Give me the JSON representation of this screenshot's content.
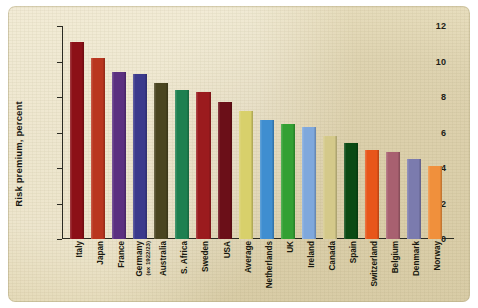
{
  "chart_data": {
    "type": "bar",
    "title": "",
    "xlabel": "",
    "ylabel": "Risk premium, percent",
    "ylim": [
      0,
      12
    ],
    "ytick_step": 2,
    "yticks": [
      "0",
      "2",
      "4",
      "6",
      "8",
      "10",
      "12"
    ],
    "grid": false,
    "legend": "none",
    "categories": [
      "Italy",
      "Japan",
      "France",
      "Germany",
      "Australia",
      "S. Africa",
      "Sweden",
      "USA",
      "Average",
      "Netherlands",
      "UK",
      "Ireland",
      "Canada",
      "Spain",
      "Switzerland",
      "Belgium",
      "Denmark",
      "Norway"
    ],
    "category_sublabels": {
      "Germany": "(ex 1922/23)"
    },
    "values": [
      11.1,
      10.2,
      9.4,
      9.3,
      8.8,
      8.4,
      8.3,
      7.7,
      7.2,
      6.7,
      6.5,
      6.3,
      5.8,
      5.4,
      5.0,
      4.9,
      4.5,
      4.1
    ],
    "bar_colors": [
      "#8C1017",
      "#B9361F",
      "#5B3080",
      "#3B3A8C",
      "#4A4520",
      "#1E8050",
      "#9B1B1E",
      "#6B0F18",
      "#D8D06B",
      "#3F8ED0",
      "#33A033",
      "#7FA8DC",
      "#D4C98A",
      "#0B4A14",
      "#E8561A",
      "#A86070",
      "#7B7BAE",
      "#F0903C"
    ],
    "background_color": "#E7DCBA",
    "axis_color": "#2A2A22"
  }
}
